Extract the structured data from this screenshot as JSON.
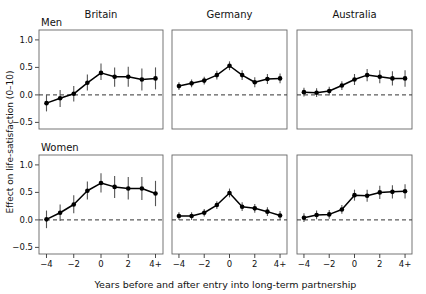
{
  "figure": {
    "xlabel": "Years before and after entry into long-term partnership",
    "ylabel": "Effect on life-satisfaction (0–10)",
    "group_labels": [
      "Men",
      "Women"
    ],
    "column_titles": [
      "Britain",
      "Germany",
      "Australia"
    ],
    "ytick_labels": [
      "1.0",
      "0.5",
      "0.0",
      "−0.5"
    ],
    "xtick_labels": [
      "−4",
      "−2",
      "0",
      "2",
      "4+"
    ],
    "line_color": "#000000",
    "marker_color": "#000000",
    "errorbar_color": "#555555",
    "zero_line_color": "#333333",
    "frame_color": "#666666"
  },
  "chart_data": {
    "type": "line",
    "title": "",
    "subtitle": "",
    "xlabel": "Years before and after entry into long-term partnership",
    "ylabel": "Effect on life-satisfaction (0–10)",
    "x": [
      -4,
      -3,
      -2,
      -1,
      0,
      1,
      2,
      3,
      4
    ],
    "xtick_positions": [
      -4,
      -2,
      0,
      2,
      4
    ],
    "xtick_labels": [
      "−4",
      "−2",
      "0",
      "2",
      "4+"
    ],
    "ytick_positions": [
      1.0,
      0.5,
      0.0,
      -0.5
    ],
    "ytick_labels": [
      "1.0",
      "0.5",
      "0.0",
      "−0.5"
    ],
    "ylim": [
      -0.62,
      1.18
    ],
    "xlim": [
      -4.55,
      4.55
    ],
    "grid": false,
    "legend": "none",
    "annotations": [
      "Men",
      "Women",
      "Britain",
      "Germany",
      "Australia"
    ],
    "reference_line": {
      "y": 0.0,
      "style": "dashed"
    },
    "panels": [
      {
        "row": "Men",
        "column": "Britain",
        "values": [
          -0.15,
          -0.06,
          0.02,
          0.22,
          0.4,
          0.33,
          0.33,
          0.28,
          0.3
        ],
        "err_low": [
          -0.3,
          -0.22,
          -0.12,
          0.08,
          0.27,
          0.15,
          0.15,
          0.08,
          0.1
        ],
        "err_high": [
          0.0,
          0.09,
          0.16,
          0.37,
          0.57,
          0.5,
          0.51,
          0.48,
          0.5
        ]
      },
      {
        "row": "Men",
        "column": "Germany",
        "values": [
          0.16,
          0.21,
          0.26,
          0.36,
          0.53,
          0.36,
          0.23,
          0.29,
          0.3
        ],
        "err_low": [
          0.09,
          0.14,
          0.19,
          0.28,
          0.45,
          0.27,
          0.14,
          0.2,
          0.21
        ],
        "err_high": [
          0.23,
          0.28,
          0.33,
          0.44,
          0.61,
          0.45,
          0.32,
          0.38,
          0.39
        ]
      },
      {
        "row": "Men",
        "column": "Australia",
        "values": [
          0.05,
          0.04,
          0.07,
          0.17,
          0.28,
          0.36,
          0.33,
          0.3,
          0.3
        ],
        "err_low": [
          -0.03,
          -0.04,
          -0.01,
          0.09,
          0.18,
          0.25,
          0.21,
          0.17,
          0.15
        ],
        "err_high": [
          0.13,
          0.12,
          0.15,
          0.25,
          0.38,
          0.47,
          0.45,
          0.43,
          0.45
        ]
      },
      {
        "row": "Women",
        "column": "Britain",
        "values": [
          0.01,
          0.13,
          0.28,
          0.53,
          0.67,
          0.6,
          0.57,
          0.57,
          0.48
        ],
        "err_low": [
          -0.15,
          -0.02,
          0.12,
          0.37,
          0.5,
          0.4,
          0.37,
          0.36,
          0.25
        ],
        "err_high": [
          0.17,
          0.28,
          0.45,
          0.7,
          0.85,
          0.8,
          0.78,
          0.78,
          0.71
        ]
      },
      {
        "row": "Women",
        "column": "Germany",
        "values": [
          0.07,
          0.07,
          0.13,
          0.27,
          0.49,
          0.24,
          0.21,
          0.15,
          0.08
        ],
        "err_low": [
          0.0,
          0.0,
          0.06,
          0.2,
          0.41,
          0.16,
          0.13,
          0.07,
          0.0
        ],
        "err_high": [
          0.14,
          0.14,
          0.2,
          0.34,
          0.57,
          0.32,
          0.29,
          0.23,
          0.16
        ]
      },
      {
        "row": "Women",
        "column": "Australia",
        "values": [
          0.04,
          0.09,
          0.1,
          0.19,
          0.45,
          0.44,
          0.5,
          0.51,
          0.52
        ],
        "err_low": [
          -0.04,
          0.01,
          0.02,
          0.11,
          0.35,
          0.33,
          0.38,
          0.39,
          0.39
        ],
        "err_high": [
          0.12,
          0.17,
          0.18,
          0.27,
          0.55,
          0.55,
          0.62,
          0.63,
          0.65
        ]
      }
    ]
  }
}
